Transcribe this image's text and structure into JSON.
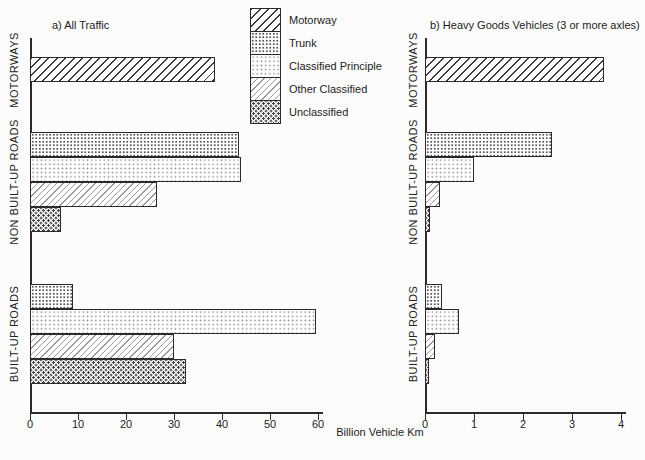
{
  "figure": {
    "xlabel": "Billion Vehicle Km"
  },
  "colors": {
    "ink": "#2b2b2b",
    "paper": "#fcfcfc"
  },
  "legend": {
    "items": [
      {
        "label": "Motorway",
        "pattern": "motorway",
        "icon": "diagonal-hatch-swatch-icon"
      },
      {
        "label": "Trunk",
        "pattern": "trunk",
        "icon": "dense-stipple-swatch-icon"
      },
      {
        "label": "Classified Principle",
        "pattern": "classified-principle",
        "icon": "light-stipple-swatch-icon"
      },
      {
        "label": "Other Classified",
        "pattern": "other-classified",
        "icon": "fine-diagonal-swatch-icon"
      },
      {
        "label": "Unclassified",
        "pattern": "unclassified",
        "icon": "coarse-dot-swatch-icon"
      }
    ]
  },
  "chart_data": [
    {
      "type": "bar",
      "orientation": "horizontal",
      "title": "a) All Traffic",
      "xlabel": "Billion Vehicle Km",
      "xlim": [
        0,
        60
      ],
      "xticks": [
        0,
        10,
        20,
        30,
        40,
        50,
        60
      ],
      "grid": false,
      "groups": [
        {
          "label": "MOTORWAYS",
          "bars": [
            {
              "series": "Motorway",
              "value": 38.5
            }
          ]
        },
        {
          "label": "NON BUILT-UP ROADS",
          "bars": [
            {
              "series": "Trunk",
              "value": 43.5
            },
            {
              "series": "Classified Principle",
              "value": 44
            },
            {
              "series": "Other Classified",
              "value": 26.5
            },
            {
              "series": "Unclassified",
              "value": 6.5
            }
          ]
        },
        {
          "label": "BUILT-UP ROADS",
          "bars": [
            {
              "series": "Trunk",
              "value": 9
            },
            {
              "series": "Classified Principle",
              "value": 59.5
            },
            {
              "series": "Other Classified",
              "value": 30
            },
            {
              "series": "Unclassified",
              "value": 32.5
            }
          ]
        }
      ]
    },
    {
      "type": "bar",
      "orientation": "horizontal",
      "title": "b) Heavy Goods Vehicles (3 or more axles)",
      "xlabel": "Billion Vehicle Km",
      "xlim": [
        0,
        4
      ],
      "xticks": [
        0,
        1,
        2,
        3,
        4
      ],
      "grid": false,
      "groups": [
        {
          "label": "MOTORWAYS",
          "bars": [
            {
              "series": "Motorway",
              "value": 3.65
            }
          ]
        },
        {
          "label": "NON BUILT-UP ROADS",
          "bars": [
            {
              "series": "Trunk",
              "value": 2.6
            },
            {
              "series": "Classified Principle",
              "value": 1.0
            },
            {
              "series": "Other Classified",
              "value": 0.3
            },
            {
              "series": "Unclassified",
              "value": 0.1
            }
          ]
        },
        {
          "label": "BUILT-UP ROADS",
          "bars": [
            {
              "series": "Trunk",
              "value": 0.35
            },
            {
              "series": "Classified Principle",
              "value": 0.7
            },
            {
              "series": "Other Classified",
              "value": 0.2
            },
            {
              "series": "Unclassified",
              "value": 0.08
            }
          ]
        }
      ]
    }
  ]
}
